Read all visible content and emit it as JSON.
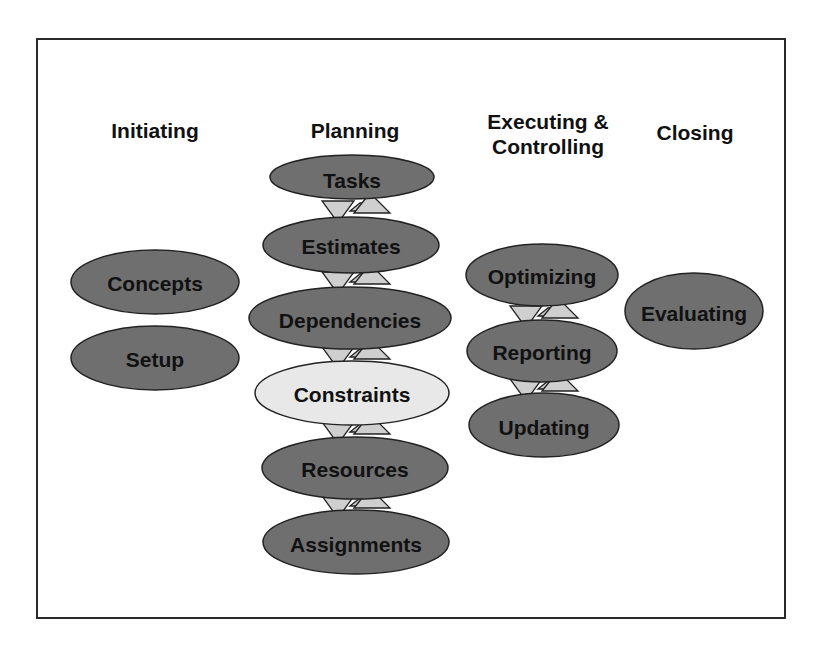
{
  "colors": {
    "node_fill": "#6f6f6f",
    "node_highlight_fill": "#e8e8e8",
    "connector_fill": "#cfcfcf",
    "border": "#2a2a2a"
  },
  "phases": [
    {
      "title": "Initiating",
      "nodes": [
        "Concepts",
        "Setup"
      ]
    },
    {
      "title": "Planning",
      "nodes": [
        "Tasks",
        "Estimates",
        "Dependencies",
        "Constraints",
        "Resources",
        "Assignments"
      ],
      "highlighted": "Constraints"
    },
    {
      "title": "Executing &\nControlling",
      "nodes": [
        "Optimizing",
        "Reporting",
        "Updating"
      ]
    },
    {
      "title": "Closing",
      "nodes": [
        "Evaluating"
      ]
    }
  ],
  "labels": {
    "initiating": "Initiating",
    "planning": "Planning",
    "executing": "Executing &\nControlling",
    "closing": "Closing",
    "concepts": "Concepts",
    "setup": "Setup",
    "tasks": "Tasks",
    "estimates": "Estimates",
    "dependencies": "Dependencies",
    "constraints": "Constraints",
    "resources": "Resources",
    "assignments": "Assignments",
    "optimizing": "Optimizing",
    "reporting": "Reporting",
    "updating": "Updating",
    "evaluating": "Evaluating"
  }
}
